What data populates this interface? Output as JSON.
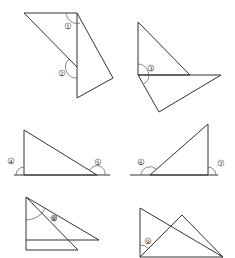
{
  "diagram": {
    "title": "",
    "panels": [
      {
        "id": "panel-1",
        "labels": [
          {
            "text": "1",
            "x": 68,
            "y": 26
          },
          {
            "text": "2",
            "x": 62,
            "y": 73
          }
        ]
      },
      {
        "id": "panel-2",
        "labels": [
          {
            "text": "3",
            "x": 151,
            "y": 68
          }
        ]
      },
      {
        "id": "panel-3",
        "labels": [
          {
            "text": "4",
            "x": 11,
            "y": 161
          },
          {
            "text": "5",
            "x": 98,
            "y": 162
          }
        ]
      },
      {
        "id": "panel-4",
        "labels": [
          {
            "text": "6",
            "x": 141,
            "y": 162
          },
          {
            "text": "7",
            "x": 221,
            "y": 163
          }
        ]
      },
      {
        "id": "panel-5",
        "labels": [
          {
            "text": "8",
            "x": 54,
            "y": 218
          }
        ]
      },
      {
        "id": "panel-6",
        "labels": [
          {
            "text": "9",
            "x": 148,
            "y": 241
          }
        ]
      }
    ],
    "angle_labels": [
      "①",
      "②",
      "③",
      "④",
      "⑤",
      "⑥",
      "⑦",
      "⑧",
      "⑨"
    ]
  }
}
